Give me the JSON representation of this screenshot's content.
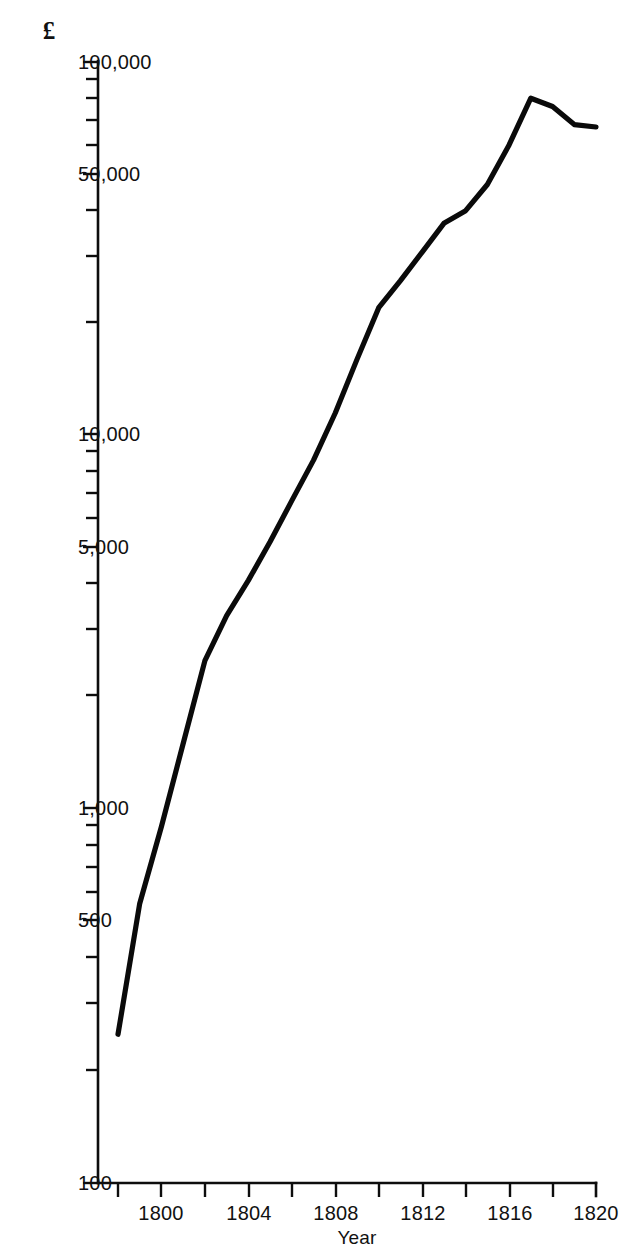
{
  "chart_data": {
    "type": "line",
    "title": "",
    "subtitle": "",
    "xlabel": "Year",
    "ylabel": "£",
    "y_scale": "log",
    "ylim": [
      100,
      100000
    ],
    "xlim": [
      1798,
      1820
    ],
    "grid": false,
    "legend": null,
    "y_tick_labels": [
      "100,000",
      "50,000",
      "10,000",
      "5,000",
      "1,000",
      "500",
      "100"
    ],
    "y_tick_values": [
      100000,
      50000,
      10000,
      5000,
      1000,
      500,
      100
    ],
    "y_minor_ticks": [
      90000,
      80000,
      70000,
      60000,
      40000,
      30000,
      20000,
      9000,
      8000,
      7000,
      6000,
      4000,
      3000,
      2000,
      900,
      800,
      700,
      600,
      400,
      300,
      200
    ],
    "x_tick_labels": [
      "1800",
      "1804",
      "1808",
      "1812",
      "1816",
      "1820"
    ],
    "x_tick_values": [
      1800,
      1804,
      1808,
      1812,
      1816,
      1820
    ],
    "x_minor_ticks": [
      1798,
      1802,
      1806,
      1810,
      1814,
      1818
    ],
    "x": [
      1798,
      1799,
      1800,
      1801,
      1802,
      1803,
      1804,
      1805,
      1806,
      1807,
      1808,
      1809,
      1810,
      1811,
      1812,
      1813,
      1814,
      1815,
      1816,
      1817,
      1818,
      1819,
      1820
    ],
    "values": [
      250,
      560,
      900,
      1500,
      2500,
      3300,
      4100,
      5200,
      6700,
      8600,
      11500,
      16000,
      22000,
      26000,
      31000,
      37000,
      40000,
      47000,
      60000,
      80000,
      76000,
      68000,
      67000
    ],
    "series": [
      {
        "name": "",
        "values": [
          250,
          560,
          900,
          1500,
          2500,
          3300,
          4100,
          5200,
          6700,
          8600,
          11500,
          16000,
          22000,
          26000,
          31000,
          37000,
          40000,
          47000,
          60000,
          80000,
          76000,
          68000,
          67000
        ]
      }
    ],
    "line_color": "#0a0a0a"
  },
  "figure": {
    "background": "#ffffff",
    "axis_color": "#0d0d0d"
  }
}
